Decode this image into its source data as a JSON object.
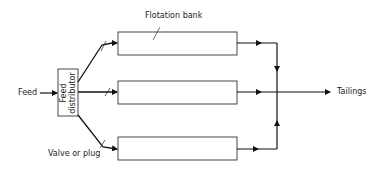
{
  "diagram": {
    "labels": {
      "feed": "Feed",
      "tailings": "Tailings",
      "flotation_bank": "Flotation bank",
      "valve": "Valve or plug",
      "distributor_line1": "Feed",
      "distributor_line2": "distributor"
    },
    "nodes": [
      {
        "id": "feed-distributor",
        "label": "Feed distributor"
      },
      {
        "id": "flotation-bank-1",
        "label": ""
      },
      {
        "id": "flotation-bank-2",
        "label": ""
      },
      {
        "id": "flotation-bank-3",
        "label": ""
      }
    ],
    "edges": [
      {
        "from": "Feed",
        "to": "feed-distributor"
      },
      {
        "from": "feed-distributor",
        "to": "flotation-bank-1",
        "valve": true
      },
      {
        "from": "feed-distributor",
        "to": "flotation-bank-2",
        "valve": true
      },
      {
        "from": "feed-distributor",
        "to": "flotation-bank-3",
        "valve": true
      },
      {
        "from": "flotation-bank-1",
        "to": "Tailings"
      },
      {
        "from": "flotation-bank-2",
        "to": "Tailings"
      },
      {
        "from": "flotation-bank-3",
        "to": "Tailings"
      }
    ]
  }
}
